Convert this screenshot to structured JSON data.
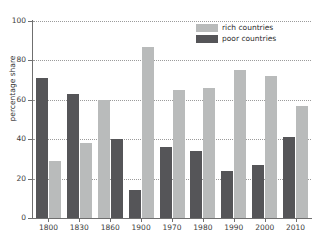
{
  "chart_data": {
    "type": "bar",
    "title": "",
    "xlabel": "",
    "ylabel": "percentage share",
    "ylim": [
      0,
      100
    ],
    "yticks": [
      0,
      20,
      40,
      60,
      80,
      100
    ],
    "grid": true,
    "legend_position": "top-right",
    "categories": [
      "1800",
      "1830",
      "1860",
      "1900",
      "1970",
      "1980",
      "1990",
      "2000",
      "2010"
    ],
    "series": [
      {
        "name": "rich countries",
        "color": "#b9bbbb",
        "values": [
          29,
          38,
          60,
          87,
          65,
          66,
          75,
          72,
          57
        ]
      },
      {
        "name": "poor countries",
        "color": "#555558",
        "values": [
          71,
          63,
          40,
          14,
          36,
          34,
          24,
          27,
          41
        ]
      }
    ],
    "series_order_by_group": [
      [
        "poor countries",
        "rich countries"
      ],
      [
        "poor countries",
        "rich countries"
      ],
      [
        "rich countries",
        "poor countries"
      ],
      [
        "poor countries",
        "rich countries"
      ],
      [
        "poor countries",
        "rich countries"
      ],
      [
        "poor countries",
        "rich countries"
      ],
      [
        "poor countries",
        "rich countries"
      ],
      [
        "poor countries",
        "rich countries"
      ],
      [
        "poor countries",
        "rich countries"
      ]
    ]
  },
  "legend": {
    "items": [
      {
        "label": "rich countries",
        "swatch": "rich"
      },
      {
        "label": "poor countries",
        "swatch": "poor"
      }
    ]
  },
  "axes": {
    "y_title": "percentage share"
  }
}
